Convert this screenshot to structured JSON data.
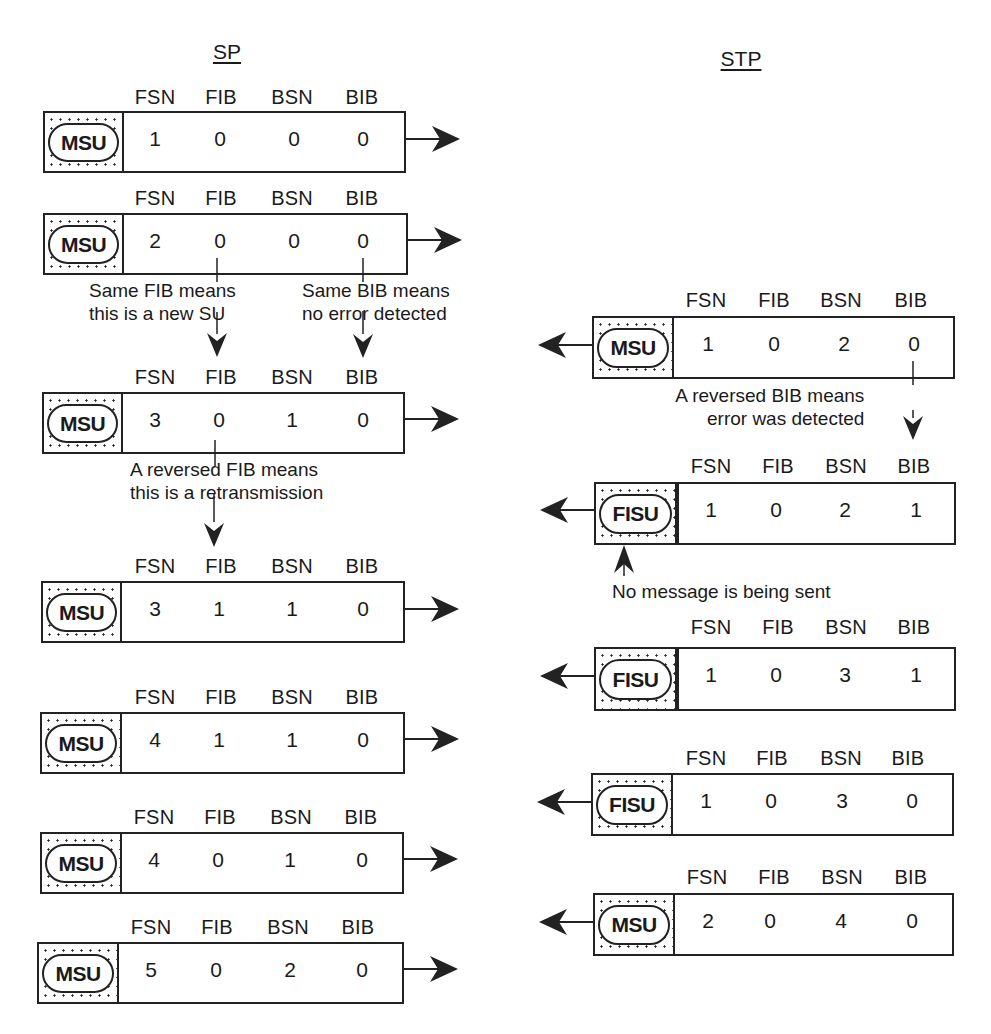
{
  "sp": {
    "title": "SP",
    "frames": [
      {
        "type": "MSU",
        "headers": [
          "FSN",
          "FIB",
          "BSN",
          "BIB"
        ],
        "values": [
          "1",
          "0",
          "0",
          "0"
        ]
      },
      {
        "type": "MSU",
        "headers": [
          "FSN",
          "FIB",
          "BSN",
          "BIB"
        ],
        "values": [
          "2",
          "0",
          "0",
          "0"
        ]
      },
      {
        "type": "MSU",
        "headers": [
          "FSN",
          "FIB",
          "BSN",
          "BIB"
        ],
        "values": [
          "3",
          "0",
          "1",
          "0"
        ]
      },
      {
        "type": "MSU",
        "headers": [
          "FSN",
          "FIB",
          "BSN",
          "BIB"
        ],
        "values": [
          "3",
          "1",
          "1",
          "0"
        ]
      },
      {
        "type": "MSU",
        "headers": [
          "FSN",
          "FIB",
          "BSN",
          "BIB"
        ],
        "values": [
          "4",
          "1",
          "1",
          "0"
        ]
      },
      {
        "type": "MSU",
        "headers": [
          "FSN",
          "FIB",
          "BSN",
          "BIB"
        ],
        "values": [
          "4",
          "0",
          "1",
          "0"
        ]
      },
      {
        "type": "MSU",
        "headers": [
          "FSN",
          "FIB",
          "BSN",
          "BIB"
        ],
        "values": [
          "5",
          "0",
          "2",
          "0"
        ]
      }
    ],
    "annotations": {
      "same_fib": [
        "Same FIB means",
        "this is a new SU"
      ],
      "same_bib": [
        "Same BIB means",
        "no error detected"
      ],
      "reversed_fib": [
        "A reversed FIB means",
        "this is a retransmission"
      ]
    }
  },
  "stp": {
    "title": "STP",
    "frames": [
      {
        "type": "MSU",
        "headers": [
          "FSN",
          "FIB",
          "BSN",
          "BIB"
        ],
        "values": [
          "1",
          "0",
          "2",
          "0"
        ]
      },
      {
        "type": "FISU",
        "headers": [
          "FSN",
          "FIB",
          "BSN",
          "BIB"
        ],
        "values": [
          "1",
          "0",
          "2",
          "1"
        ]
      },
      {
        "type": "FISU",
        "headers": [
          "FSN",
          "FIB",
          "BSN",
          "BIB"
        ],
        "values": [
          "1",
          "0",
          "3",
          "1"
        ]
      },
      {
        "type": "FISU",
        "headers": [
          "FSN",
          "FIB",
          "BSN",
          "BIB"
        ],
        "values": [
          "1",
          "0",
          "3",
          "0"
        ]
      },
      {
        "type": "MSU",
        "headers": [
          "FSN",
          "FIB",
          "BSN",
          "BIB"
        ],
        "values": [
          "2",
          "0",
          "4",
          "0"
        ]
      }
    ],
    "annotations": {
      "reversed_bib": [
        "A reversed BIB means",
        "error was detected"
      ],
      "no_message": "No message is being sent"
    }
  }
}
